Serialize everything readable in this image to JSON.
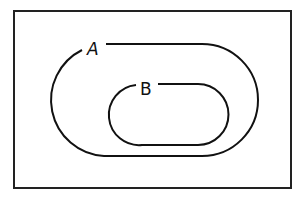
{
  "diagram": {
    "type": "euler",
    "title": "",
    "universe": {
      "label": ""
    },
    "sets": [
      {
        "id": "A",
        "label": "A",
        "contains": [
          "B"
        ]
      },
      {
        "id": "B",
        "label": "B",
        "subset_of": "A"
      }
    ],
    "relationship": "B ⊂ A",
    "colors": {
      "stroke": "#111111",
      "background": "#ffffff"
    }
  }
}
